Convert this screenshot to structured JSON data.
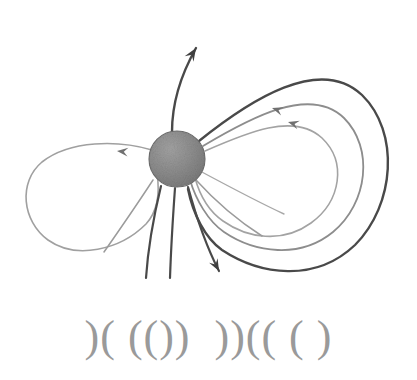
{
  "figure": {
    "name": "planetary-magnetic-field-diagram",
    "background_color": "#ffffff",
    "caption_glyphs": ")( (())  ))(( ( )",
    "caption_color": "#9a9a9a"
  },
  "body": {
    "label": "central-body",
    "center_x": 177,
    "center_y": 159,
    "radius": 28,
    "fill_color": "#8c8c8c",
    "edge_color": "#6e6e6e"
  },
  "palette": {
    "dark_line": "#4a4a4a",
    "mid_line": "#6f6f6f",
    "light_line": "#9b9b9b",
    "very_light_line": "#b0b0b0",
    "arrow_dark": "#3f3f3f",
    "arrow_mid": "#707070"
  },
  "chart_data": {
    "type": "diagram",
    "title": "",
    "xlabel": "",
    "ylabel": "",
    "elements": [
      {
        "name": "closed-loop-outer-right",
        "kind": "closed-field-line",
        "color": "#4a4a4a",
        "width": 2.4,
        "path": "M 199 141 C 250 100, 320 55, 362 95 C 400 132, 395 205, 355 245 C 315 283, 260 275, 222 250 C 205 238, 193 214, 188 189"
      },
      {
        "name": "closed-loop-middle-right",
        "kind": "closed-field-line",
        "color": "#8d8d8d",
        "width": 1.8,
        "path": "M 203 146 C 250 118, 310 85, 344 118 C 374 148, 368 203, 333 232 C 300 259, 255 253, 224 232 C 208 221, 196 200, 190 180"
      },
      {
        "name": "closed-loop-inner-right",
        "kind": "closed-field-line",
        "color": "#a3a3a3",
        "width": 1.6,
        "path": "M 205 151 C 246 133, 294 112, 322 138 C 347 162, 341 201, 311 223 C 282 244, 247 238, 223 221 C 210 212, 200 196, 195 178"
      },
      {
        "name": "open-lobe-left",
        "kind": "closed-field-line",
        "color": "#a0a0a0",
        "width": 1.6,
        "path": "M 152 150 C 118 140, 70 140, 42 162 C 18 182, 22 221, 48 240 C 76 260, 120 250, 146 224 C 158 211, 160 193, 157 173"
      },
      {
        "name": "polar-open-line-north",
        "kind": "open-field-line",
        "color": "#4a4a4a",
        "width": 2.4,
        "path": "M 172 132 C 172 110, 178 80, 196 48"
      },
      {
        "name": "open-line-south-left-a",
        "kind": "open-field-line",
        "color": "#4a4a4a",
        "width": 2.2,
        "path": "M 161 186 C 154 215, 148 248, 146 278"
      },
      {
        "name": "open-line-south-left-b",
        "kind": "open-field-line",
        "color": "#4a4a4a",
        "width": 2.2,
        "path": "M 175 188 C 173 216, 171 248, 170 278"
      },
      {
        "name": "open-line-south-right",
        "kind": "open-field-line",
        "color": "#4a4a4a",
        "width": 2.2,
        "path": "M 188 187 C 196 216, 206 246, 219 271"
      },
      {
        "name": "open-line-southwest-faint",
        "kind": "open-field-line",
        "color": "#9b9b9b",
        "width": 1.5,
        "path": "M 153 180 C 136 206, 118 232, 104 252"
      },
      {
        "name": "open-line-southeast-faint-a",
        "kind": "open-field-line",
        "color": "#9b9b9b",
        "width": 1.5,
        "path": "M 196 180 C 216 202, 240 222, 262 236"
      },
      {
        "name": "open-line-southeast-faint-b",
        "kind": "open-field-line",
        "color": "#a8a8a8",
        "width": 1.4,
        "path": "M 200 171 C 228 186, 258 202, 284 214"
      }
    ],
    "arrows": [
      {
        "name": "arrow-north-outflow",
        "x": 196,
        "y": 48,
        "angle": -58,
        "color": "#3f3f3f",
        "size": 13
      },
      {
        "name": "arrow-south-outflow",
        "x": 219,
        "y": 271,
        "angle": 62,
        "color": "#3f3f3f",
        "size": 12
      },
      {
        "name": "arrow-left-lobe-inflow",
        "x": 117,
        "y": 151,
        "angle": 186,
        "color": "#707070",
        "size": 11
      },
      {
        "name": "arrow-right-loop-outer",
        "x": 272,
        "y": 108,
        "angle": 198,
        "color": "#707070",
        "size": 11
      },
      {
        "name": "arrow-right-loop-inner",
        "x": 288,
        "y": 122,
        "angle": 196,
        "color": "#707070",
        "size": 11
      }
    ]
  }
}
